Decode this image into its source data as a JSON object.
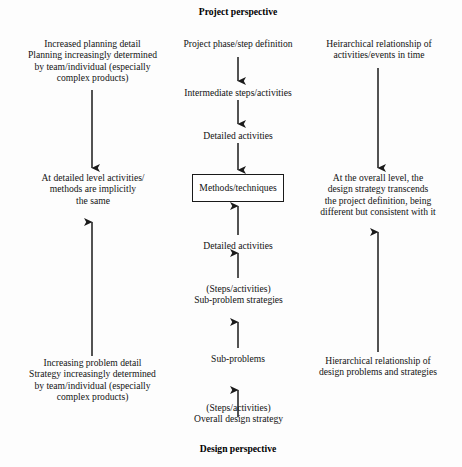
{
  "diagram": {
    "title_top": "Project perspective",
    "title_bottom": "Design perspective",
    "colors": {
      "background": "#fdfdfd",
      "ink": "#111111",
      "arrow": "#1a1a1a",
      "box_border": "#1a1a1a"
    },
    "center_column": {
      "nodes": [
        {
          "id": "project-phase-step-definition",
          "label": "Project phase/step definition"
        },
        {
          "id": "intermediate-steps-activities",
          "label": "Intermediate steps/activities"
        },
        {
          "id": "detailed-activities-upper",
          "label": "Detailed activities"
        },
        {
          "id": "methods-techniques",
          "label": "Methods/techniques",
          "boxed": true
        },
        {
          "id": "detailed-activities-lower",
          "label": "Detailed activities"
        },
        {
          "id": "sub-problem-strategies",
          "label": "(Steps/activities)\nSub-problem strategies"
        },
        {
          "id": "sub-problems",
          "label": "Sub-problems"
        },
        {
          "id": "overall-design-strategy",
          "label": "(Steps/activities)\nOverall design strategy"
        }
      ]
    },
    "left_column": {
      "top_note": "Increased planning detail\nPlanning increasingly determined\nby team/individual (especially\ncomplex products)",
      "middle_note": "At detailed level activities/\nmethods are implicitly\nthe same",
      "bottom_note": "Increasing problem detail\nStrategy increasingly determined\nby team/individual (especially\ncomplex products)"
    },
    "right_column": {
      "top_note": "Heirarchical relationship of\nactivities/events in time",
      "middle_note": "At the overall level, the\ndesign strategy transcends\nthe project definition, being\ndifferent but consistent with it",
      "bottom_note": "Hierarchical relationship of\ndesign problems and strategies"
    },
    "arrows": [
      {
        "id": "center-arrow-1",
        "direction": "down",
        "from": "project-phase-step-definition",
        "to": "intermediate-steps-activities"
      },
      {
        "id": "center-arrow-2",
        "direction": "down",
        "from": "intermediate-steps-activities",
        "to": "detailed-activities-upper"
      },
      {
        "id": "center-arrow-3",
        "direction": "down",
        "from": "detailed-activities-upper",
        "to": "methods-techniques"
      },
      {
        "id": "center-arrow-4",
        "direction": "up",
        "from": "detailed-activities-lower",
        "to": "methods-techniques"
      },
      {
        "id": "center-arrow-5",
        "direction": "up",
        "from": "sub-problem-strategies",
        "to": "detailed-activities-lower"
      },
      {
        "id": "center-arrow-6",
        "direction": "up",
        "from": "sub-problems",
        "to": "sub-problem-strategies"
      },
      {
        "id": "center-arrow-7",
        "direction": "up",
        "from": "overall-design-strategy",
        "to": "sub-problems"
      },
      {
        "id": "left-arrow-down",
        "direction": "down",
        "from": "left-top-note",
        "to": "left-middle-note"
      },
      {
        "id": "left-arrow-up",
        "direction": "up",
        "from": "left-bottom-note",
        "to": "left-middle-note"
      },
      {
        "id": "right-arrow-down",
        "direction": "down",
        "from": "right-top-note",
        "to": "right-middle-note"
      },
      {
        "id": "right-arrow-up",
        "direction": "up",
        "from": "right-bottom-note",
        "to": "right-middle-note"
      }
    ]
  }
}
